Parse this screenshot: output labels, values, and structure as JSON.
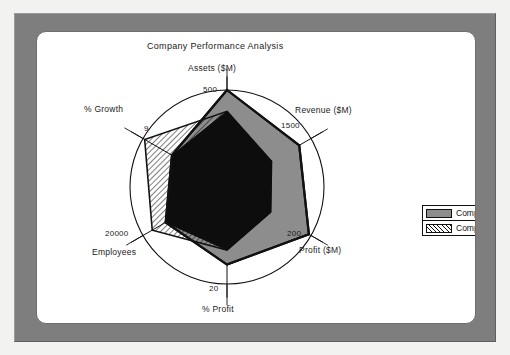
{
  "window": {
    "frame_color": "#7e7e7e",
    "panel_color": "#ffffff"
  },
  "chart_data": {
    "type": "radar",
    "title": "Company Performance Analysis",
    "xlabel": "",
    "ylabel": "",
    "grid": false,
    "legend_position": "right",
    "axes": [
      {
        "label": "Assets ($M)",
        "tick": "500",
        "max": 500,
        "angle_deg": 0
      },
      {
        "label": "Revenue ($M)",
        "tick": "1500",
        "max": 1500,
        "angle_deg": 60
      },
      {
        "label": "Profit ($M)",
        "tick": "200",
        "max": 200,
        "angle_deg": 120
      },
      {
        "label": "% Profit",
        "tick": "20",
        "max": 20,
        "angle_deg": 180
      },
      {
        "label": "Employees",
        "tick": "20000",
        "max": 20000,
        "angle_deg": 240
      },
      {
        "label": "% Growth",
        "tick": "9",
        "max": 9,
        "angle_deg": 300
      }
    ],
    "categories": [
      "Assets ($M)",
      "Revenue ($M)",
      "Profit ($M)",
      "% Profit",
      "Employees",
      "% Growth"
    ],
    "series": [
      {
        "name": "Company A",
        "fill": "#8d8d8d",
        "pattern": "solid",
        "values": [
          500,
          1290,
          195,
          16.0,
          14600,
          5.9
        ],
        "normalized": [
          1.0,
          0.86,
          0.975,
          0.8,
          0.73,
          0.655
        ]
      },
      {
        "name": "Company B",
        "fill": "#ffffff",
        "pattern": "diagonal-hatch",
        "values": [
          390,
          795,
          104,
          13.0,
          17800,
          8.8
        ],
        "normalized": [
          0.78,
          0.53,
          0.52,
          0.65,
          0.89,
          0.98
        ]
      }
    ]
  },
  "legend": {
    "items": [
      {
        "label": "Company A",
        "pattern": "solid"
      },
      {
        "label": "Company B",
        "pattern": "diagonal-hatch"
      }
    ]
  },
  "labels": {
    "title": "Company Performance Analysis",
    "assets": "Assets ($M)",
    "assets_tick": "500",
    "revenue": "Revenue ($M)",
    "revenue_tick": "1500",
    "profit": "Profit ($M)",
    "profit_tick": "200",
    "pct_profit": "% Profit",
    "pct_profit_tick": "20",
    "employees": "Employees",
    "employees_tick": "20000",
    "pct_growth": "% Growth",
    "pct_growth_tick": "9"
  }
}
